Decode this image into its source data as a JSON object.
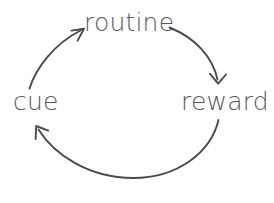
{
  "diagram": {
    "type": "cycle-diagram",
    "direction": "clockwise",
    "background_color": "#ffffff",
    "stroke_color": "#4a4a4a",
    "text_color": "#595959",
    "nodes": [
      {
        "id": "cue",
        "label": "cue",
        "position": "left"
      },
      {
        "id": "routine",
        "label": "routine",
        "position": "top"
      },
      {
        "id": "reward",
        "label": "reward",
        "position": "right"
      }
    ],
    "arrows": [
      {
        "id": "cue-to-routine",
        "from": "cue",
        "to": "routine",
        "arrowhead": "up-right"
      },
      {
        "id": "routine-to-reward",
        "from": "routine",
        "to": "reward",
        "arrowhead": "down"
      },
      {
        "id": "reward-to-cue",
        "from": "reward",
        "to": "cue",
        "arrowhead": "up-left"
      }
    ]
  }
}
